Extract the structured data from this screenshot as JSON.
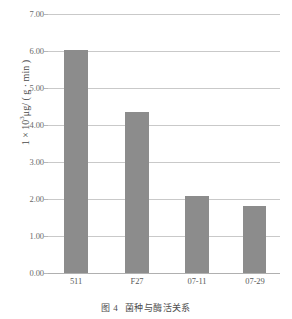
{
  "chart_data": {
    "type": "bar",
    "title": "",
    "xlabel": "",
    "ylabel": "1 × 10³μg/ ( g · min )",
    "ylabel_parts": {
      "prefix": "1 × 10",
      "exponent": "3",
      "suffix": "μg/ ( g · min )"
    },
    "categories": [
      "511",
      "F27",
      "07-11",
      "07-29"
    ],
    "values": [
      6.03,
      4.35,
      2.07,
      1.82
    ],
    "ylim": [
      0.0,
      7.0
    ],
    "ytick_labels": [
      "7.00",
      "6.00",
      "5.00",
      "4.00",
      "3.00",
      "2.00",
      "1.00",
      "0.00"
    ],
    "ytick_values": [
      7.0,
      6.0,
      5.0,
      4.0,
      3.0,
      2.0,
      1.0,
      0.0
    ],
    "grid": true,
    "legend": "none",
    "bar_color": "#8c8c8c",
    "gridline_color": "#c9c9c9",
    "background_color": "#ffffff"
  },
  "caption": {
    "number": "图 4",
    "text": "菌种与酶活关系"
  }
}
